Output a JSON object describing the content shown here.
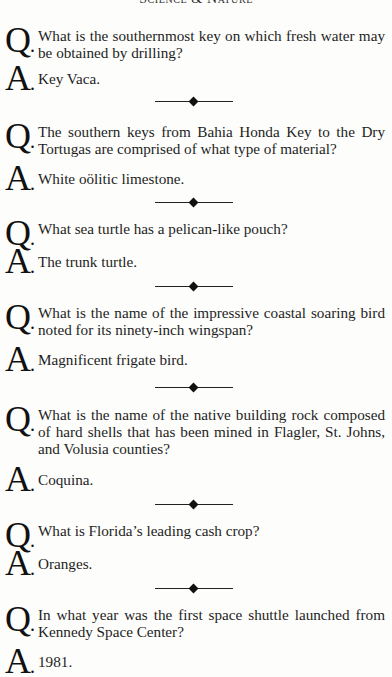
{
  "header": {
    "running_title": "Science & Nature"
  },
  "labels": {
    "question": "Q",
    "answer": "A",
    "dot": "."
  },
  "items": [
    {
      "question": "What is the southernmost key on which fresh water may be obtained by drilling?",
      "answer": "Key Vaca."
    },
    {
      "question": "The southern keys from Bahia Honda Key to the Dry Tortugas are comprised of what type of material?",
      "answer": "White oölitic limestone."
    },
    {
      "question": "What sea turtle has a pelican-like pouch?",
      "answer": "The trunk turtle."
    },
    {
      "question": "What is the name of the impressive coastal soaring bird noted for its ninety-inch wingspan?",
      "answer": "Magnificent frigate bird."
    },
    {
      "question": "What is the name of the native building rock composed of hard shells that has been mined in Flagler, St. Johns, and Volusia counties?",
      "answer": "Coquina."
    },
    {
      "question": "What is Florida’s leading cash crop?",
      "answer": "Oranges."
    },
    {
      "question": "In what year was the first space shuttle launched from Kennedy Space Center?",
      "answer": "1981."
    }
  ]
}
